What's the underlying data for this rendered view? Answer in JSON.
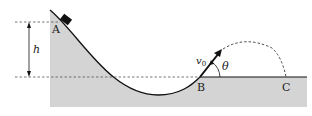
{
  "diagram": {
    "labels": {
      "point_a": "A",
      "point_b": "B",
      "point_c": "C",
      "height": "h",
      "velocity": "v",
      "velocity_sub": "0",
      "angle": "θ"
    },
    "colors": {
      "ground_fill": "#d4d4d4",
      "line": "#111111",
      "dash": "#555555"
    }
  }
}
